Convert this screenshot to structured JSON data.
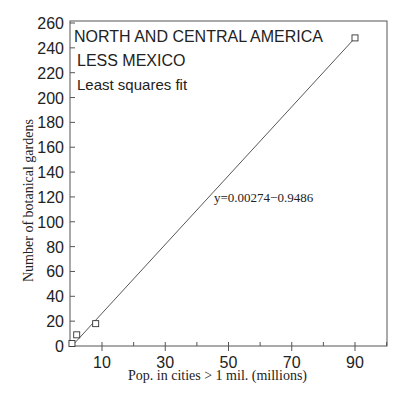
{
  "chart_data": {
    "type": "scatter",
    "title_lines": [
      "NORTH AND CENTRAL AMERICA",
      "LESS MEXICO",
      "Least squares fit"
    ],
    "xlabel": "Pop. in cities > 1 mil. (millions)",
    "ylabel": "Number of botanical gardens",
    "equation": "y=0.00274−0.9486",
    "xlim": [
      0,
      100
    ],
    "ylim": [
      0,
      260
    ],
    "x_ticks": [
      10,
      30,
      50,
      70,
      90
    ],
    "y_ticks": [
      0,
      20,
      40,
      60,
      80,
      100,
      120,
      140,
      160,
      180,
      200,
      220,
      240,
      260
    ],
    "grid": false,
    "points": [
      {
        "x": 0.5,
        "y": 2
      },
      {
        "x": 2,
        "y": 9
      },
      {
        "x": 8,
        "y": 18
      },
      {
        "x": 90,
        "y": 248
      }
    ],
    "fit_line": {
      "x": [
        0.5,
        90
      ],
      "y": [
        0,
        248
      ]
    }
  }
}
